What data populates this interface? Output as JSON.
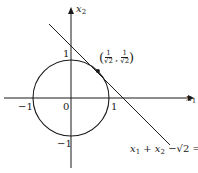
{
  "diagram": {
    "type": "geometry-plot",
    "axes": {
      "x_label": "x",
      "x_sub": "1",
      "y_label": "x",
      "y_sub": "2"
    },
    "ticks": {
      "origin": "0",
      "x_pos": "1",
      "x_neg": "−1",
      "y_pos": "1",
      "y_neg": "−1"
    },
    "circle": {
      "center": [
        0,
        0
      ],
      "radius": 1
    },
    "tangent_line": {
      "equation_parts": {
        "x1": "x",
        "s1": "1",
        "plus": " + ",
        "x2": "x",
        "s2": "2",
        "rest": " −√2 = 0"
      }
    },
    "tangent_point": {
      "open": "(",
      "num1": "1",
      "den1": "√2",
      "comma": ",",
      "num2": "1",
      "den2": "√2",
      "close": ")"
    },
    "colors": {
      "ink": "#1a1a1a",
      "background": "#ffffff"
    }
  }
}
